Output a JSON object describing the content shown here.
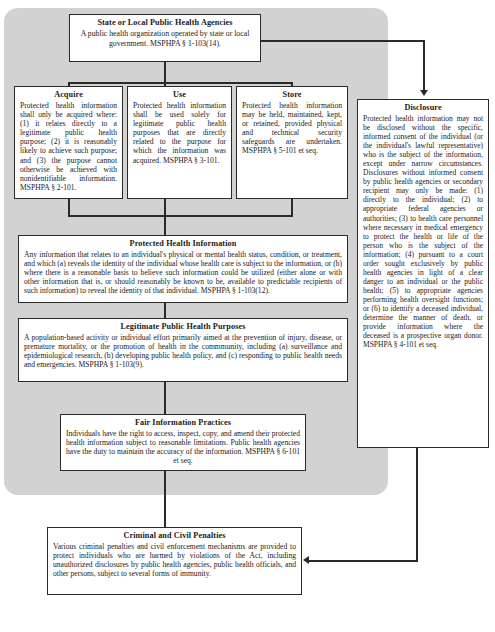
{
  "diagram": {
    "accent": "#2a2a2a",
    "panel_color": "#d2d2d2"
  },
  "boxes": {
    "agencies": {
      "title": "State or Local Public Health Agencies",
      "body": "A public health organization operated by state or local government. MSPHPA § 1-103(14)."
    },
    "acquire": {
      "title": "Acquire",
      "body": "Protected health information shall only be acquired where: (1) it relates directly to a legitimate public health purpose; (2) it is reasonably likely to achieve such purpose; and (3) the purpose cannot otherwise be achieved with nonidentifiable information. MSPHPA § 2-101."
    },
    "use": {
      "title": "Use",
      "body": "Protected health information shall be used solely for legitimate public health purposes that are directly related to the purpose for which the information was acquired. MSPHPA § 3-101."
    },
    "store": {
      "title": "Store",
      "body": "Protected health information may be held, maintained, kept, or retained, provided physical and technical security safeguards are undertaken. MSPHPA § 5-101 et seq."
    },
    "disclosure": {
      "title": "Disclosure",
      "body": "Protected health information may not be disclosed without the specific, informed consent of the individual (or the individual's lawful representative) who is the subject of the information, except under narrow circumstances. Disclosures without informed consent by public health agencies or secondary recipient may only be made: (1) directly to the individual; (2) to appropriate federal agencies or authorities; (3) to health care personnel where necessary in medical emergency to protect the health or life of the person who is the subject of the information; (4) pursuant to a court order sought exclusively by public health agencies in light of a clear danger to an individual or the public health; (5) to appropriate agencies performing health oversight functions; or (6) to identify a deceased individual, determine the manner of death, or provide information where the deceased is a prospective organ donor. MSPHPA § 4-101 et seq."
    },
    "protected_health_information": {
      "title": "Protected Health Information",
      "body": "Any information that relates to an individual's physical or mental health status, condition, or treatment, and which (a) reveals the identity of the individual whose health care is subject to the information, or (b) where there is a reasonable basis to believe such information could be utilized (either alone or with other information that is, or should reasonably be known to be, available to predictable recipients of such information) to reveal the identity of that individual. MSPHPA § 1-103(12)."
    },
    "legitimate_public_health_purposes": {
      "title": "Legitimate Public Health Purposes",
      "body": "A population-based activity or individual effort primarily aimed at the prevention of injury, disease, or premature mortality, or the promotion of health in the commmunity, including (a) surveillance and epidemiological research, (b) developing public health policy, and (c) responding to public health needs and emergencies. MSPHPA § 1-103(9)."
    },
    "fair_information_practices": {
      "title": "Fair Information Practices",
      "body": "Individuals have the right to access, inspect, copy, and amend their protected health information subject to reasonable limitations. Public health agencies have the duty to maintain the accuracy of the information. MSPHPA § 6-101 et seq."
    },
    "penalties": {
      "title": "Criminal and Civil Penalties",
      "body": "Various criminal penalties and civil enforcement mechanisms are provided to protect individuals who are harmed by violations of the Act, including unauthorized disclosures by public health agencies, public health officials, and other persons, subject to several forms of immunity."
    }
  }
}
